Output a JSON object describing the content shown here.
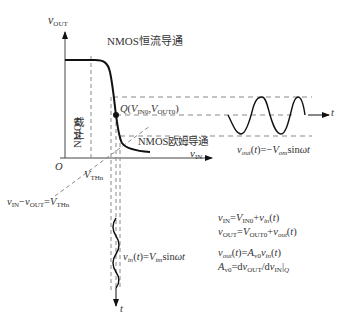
{
  "diagram": {
    "axes": {
      "y_label": "v_OUT",
      "x_label": "v_IN",
      "origin": "O"
    },
    "regions": {
      "saturation": "NMOS恒流导通",
      "cutoff_line1": "NMOS",
      "cutoff_line2": "截止",
      "triode": "NMOS欧姆导通"
    },
    "points": {
      "q_point": "Q(V_IN0,V_OUT0)",
      "threshold": "V_THn"
    },
    "boundary_equation": "v_IN−v_OUT=V_THn",
    "output_wave": {
      "axis_label": "t",
      "equation": "v_out(t)=−V_om sinωt"
    },
    "input_wave": {
      "axis_label": "t",
      "equation": "v_in(t)=V_im sinωt"
    },
    "equations": [
      "v_IN=V_IN0+v_in(t)",
      "v_OUT=V_OUT0+v_out(t)",
      "v_out(t)=A_v0 v_in(t)",
      "A_v0=dv_OUT/dv_IN|_Q"
    ],
    "colors": {
      "line": "#111111",
      "dashed": "#888888",
      "text": "#333333"
    }
  }
}
